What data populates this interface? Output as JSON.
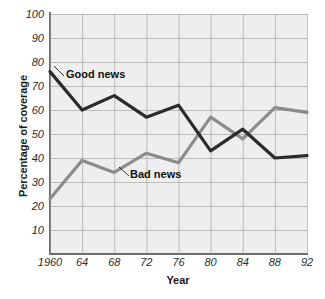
{
  "chart_data": {
    "type": "line",
    "title": "",
    "xlabel": "Year",
    "ylabel": "Percentage of coverage",
    "xlim": [
      1960,
      1992
    ],
    "ylim": [
      0,
      100
    ],
    "grid": true,
    "legend_position": "inline-annotations",
    "x": [
      1960,
      1964,
      1968,
      1972,
      1976,
      1980,
      1984,
      1988,
      1992
    ],
    "xtick_labels": [
      "1960",
      "64",
      "68",
      "72",
      "76",
      "80",
      "84",
      "88",
      "92"
    ],
    "ytick_labels": [
      "10",
      "20",
      "30",
      "40",
      "50",
      "60",
      "70",
      "80",
      "90",
      "100"
    ],
    "ytick_values": [
      10,
      20,
      30,
      40,
      50,
      60,
      70,
      80,
      90,
      100
    ],
    "series": [
      {
        "name": "Good news",
        "color": "#2b2b2b",
        "values": [
          76,
          60,
          66,
          57,
          62,
          43,
          52,
          40,
          41
        ]
      },
      {
        "name": "Bad news",
        "color": "#8c8c8c",
        "values": [
          23,
          39,
          34,
          42,
          38,
          57,
          48,
          61,
          59
        ]
      }
    ],
    "annotations": [
      {
        "text": "Good news",
        "series": "Good news"
      },
      {
        "text": "Bad news",
        "series": "Bad news"
      }
    ]
  },
  "colors": {
    "plot_background": "#eeeeee",
    "page_background": "#ffffff",
    "grid": "#9a9a9a",
    "axis": "#6b6b6b",
    "good_news": "#2b2b2b",
    "bad_news": "#8c8c8c",
    "text": "#1a1a1a"
  }
}
